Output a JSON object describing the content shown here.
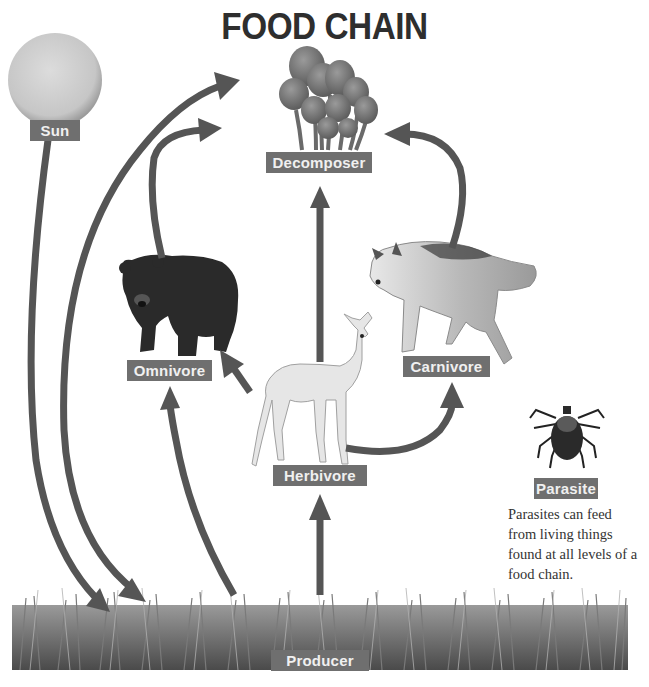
{
  "title": "FOOD CHAIN",
  "nodes": {
    "sun": {
      "label": "Sun",
      "icon": "sun-icon"
    },
    "decomposer": {
      "label": "Decomposer",
      "icon": "mushroom-icon"
    },
    "omnivore": {
      "label": "Omnivore",
      "icon": "bear-icon"
    },
    "carnivore": {
      "label": "Carnivore",
      "icon": "wolf-icon"
    },
    "herbivore": {
      "label": "Herbivore",
      "icon": "deer-icon"
    },
    "parasite": {
      "label": "Parasite",
      "icon": "tick-icon"
    },
    "producer": {
      "label": "Producer",
      "icon": "grass-icon"
    }
  },
  "parasite_note": "Parasites can feed from living things found at all levels of a food chain.",
  "arrows": [
    {
      "from": "Sun",
      "to": "Producer"
    },
    {
      "from": "Decomposer",
      "to": "Producer"
    },
    {
      "from": "Producer",
      "to": "Decomposer"
    },
    {
      "from": "Omnivore",
      "to": "Decomposer"
    },
    {
      "from": "Carnivore",
      "to": "Decomposer"
    },
    {
      "from": "Herbivore",
      "to": "Decomposer"
    },
    {
      "from": "Producer",
      "to": "Omnivore"
    },
    {
      "from": "Herbivore",
      "to": "Omnivore"
    },
    {
      "from": "Herbivore",
      "to": "Carnivore"
    },
    {
      "from": "Producer",
      "to": "Herbivore"
    }
  ],
  "colors": {
    "arrow": "#555555",
    "label_bg": "#6f6f6f",
    "label_text": "#f0f0f0",
    "title": "#2e2e2e"
  }
}
